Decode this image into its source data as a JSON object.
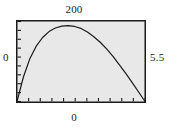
{
  "figure": {
    "name": "parametric-curve-plot",
    "background_color": "#ffffff",
    "plot_background_color": "#e8e8e8",
    "frame_color": "#1a1a1a",
    "curve_color": "#1a1a1a"
  },
  "labels": {
    "top": "200",
    "left": "0",
    "right": "5.5",
    "bottom": "0"
  },
  "chart_data": {
    "type": "line",
    "title": "",
    "xlabel": "",
    "ylabel": "",
    "xlim": [
      0,
      5.5
    ],
    "ylim": [
      0,
      200
    ],
    "grid": false,
    "legend": null,
    "frame": true,
    "x_origin_label": "0",
    "x_max_label": "5.5",
    "y_origin_label": "0",
    "y_max_label": "200",
    "x_tick_count": 11,
    "y_tick_count": 9,
    "x": [
      0.0,
      0.275,
      0.55,
      0.825,
      1.1,
      1.375,
      1.65,
      1.925,
      2.2,
      2.475,
      2.75,
      3.025,
      3.3,
      3.575,
      3.85,
      4.125,
      4.4,
      4.675,
      4.95,
      5.225,
      5.5
    ],
    "y": [
      0,
      62,
      108,
      140,
      162,
      177,
      186,
      191,
      192,
      190,
      185,
      176,
      164,
      150,
      133,
      114,
      93,
      71,
      48,
      24,
      0
    ],
    "series": [
      {
        "name": "curve",
        "values": [
          0,
          62,
          108,
          140,
          162,
          177,
          186,
          191,
          192,
          190,
          185,
          176,
          164,
          150,
          133,
          114,
          93,
          71,
          48,
          24,
          0
        ]
      }
    ]
  }
}
